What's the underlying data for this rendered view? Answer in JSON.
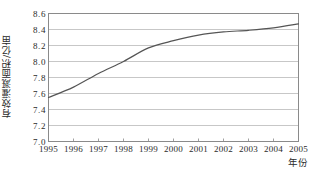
{
  "chart_data": {
    "type": "line",
    "title": "",
    "xlabel": "年份",
    "ylabel": "有效灌溉面积/亿亩",
    "categories": [
      1995,
      1996,
      1997,
      1998,
      1999,
      2000,
      2001,
      2002,
      2003,
      2004,
      2005
    ],
    "x_tick_labels": [
      "1995",
      "1996",
      "1997",
      "1998",
      "1999",
      "2000",
      "2001",
      "2002",
      "2003",
      "2004",
      "2005"
    ],
    "y_tick_labels": [
      "8.6",
      "8.4",
      "8.2",
      "8.0",
      "7.8",
      "7.6",
      "7.4",
      "7.2",
      "7.0"
    ],
    "y_ticks": [
      8.6,
      8.4,
      8.2,
      8.0,
      7.8,
      7.6,
      7.4,
      7.2,
      7.0
    ],
    "values": [
      7.55,
      7.68,
      7.85,
      8.0,
      8.17,
      8.26,
      8.33,
      8.37,
      8.39,
      8.42,
      8.47
    ],
    "series": [
      {
        "name": "有效灌溉面积",
        "values": [
          7.55,
          7.68,
          7.85,
          8.0,
          8.17,
          8.26,
          8.33,
          8.37,
          8.39,
          8.42,
          8.47
        ]
      }
    ],
    "xlim": [
      1995,
      2005
    ],
    "ylim": [
      7.0,
      8.6
    ],
    "grid": true,
    "grid_axis": "y",
    "legend": "none",
    "line_color": "#555555",
    "grid_color": "#b9b9b9",
    "axis_color": "#8a8a8a",
    "background": "#ffffff",
    "markers": false,
    "smooth": true
  }
}
